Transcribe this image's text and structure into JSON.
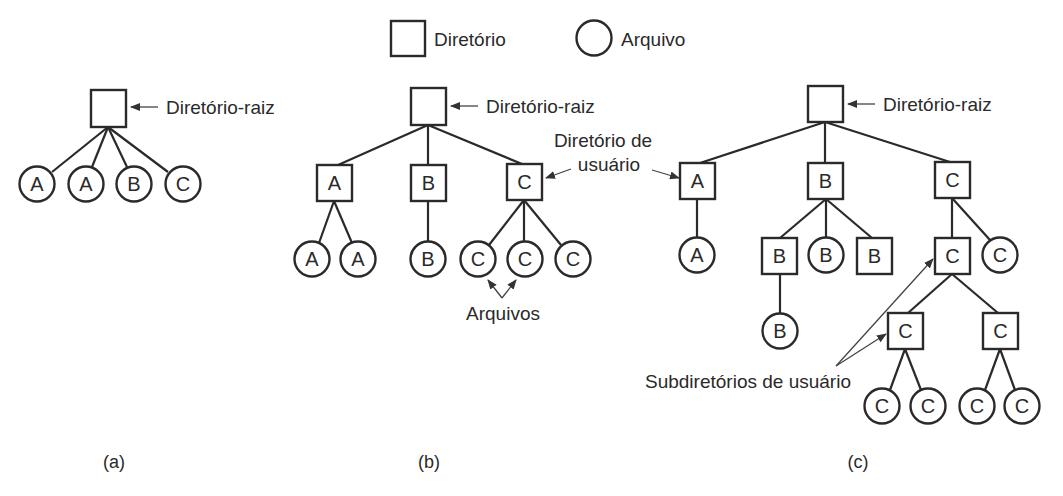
{
  "legend": {
    "directory_label": "Diretório",
    "file_label": "Arquivo"
  },
  "colors": {
    "stroke": "#2a2a2a",
    "background": "#ffffff"
  },
  "diagrams": {
    "a": {
      "caption": "(a)",
      "root_label": "Diretório-raiz",
      "files": [
        "A",
        "A",
        "B",
        "C"
      ]
    },
    "b": {
      "caption": "(b)",
      "root_label": "Diretório-raiz",
      "user_dir_annotation_line1": "Diretório de",
      "user_dir_annotation_line2": "usuário",
      "files_annotation": "Arquivos",
      "user_dirs": [
        {
          "name": "A",
          "files": [
            "A",
            "A"
          ]
        },
        {
          "name": "B",
          "files": [
            "B"
          ]
        },
        {
          "name": "C",
          "files": [
            "C",
            "C",
            "C"
          ]
        }
      ]
    },
    "c": {
      "caption": "(c)",
      "root_label": "Diretório-raiz",
      "subdirs_annotation": "Subdiretórios de usuário",
      "user_dirs": {
        "A": {
          "name": "A",
          "children": [
            "A"
          ]
        },
        "B": {
          "name": "B",
          "subdir1": "B",
          "file": "B",
          "subdir2": "B",
          "subdir1_file": "B"
        },
        "C": {
          "name": "C",
          "subdir": "C",
          "file": "C",
          "sub_subdir1": "C",
          "sub_subdir2": "C",
          "leaves": [
            "C",
            "C",
            "C",
            "C"
          ]
        }
      }
    }
  }
}
